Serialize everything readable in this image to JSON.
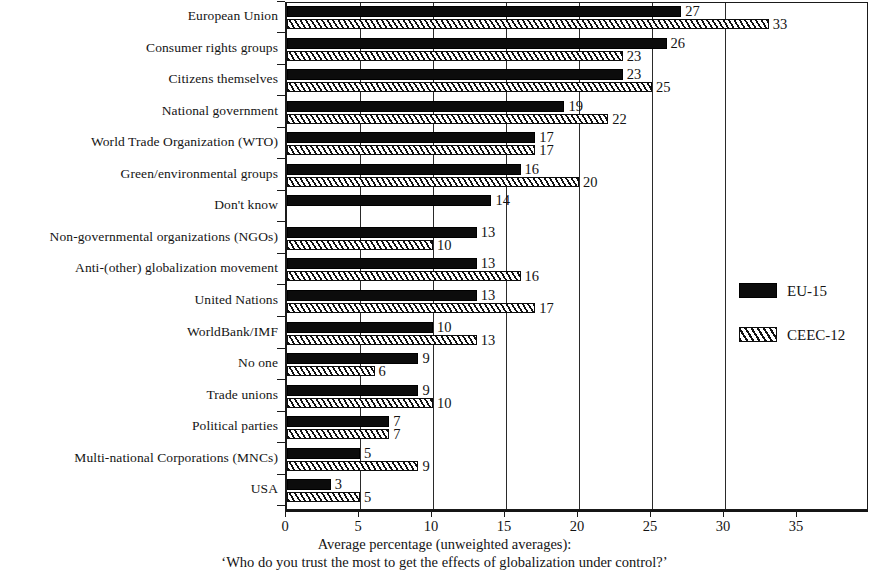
{
  "chart_data": {
    "type": "bar",
    "orientation": "horizontal",
    "title": "",
    "xlabel": "Average percentage (unweighted averages):",
    "subtitle": "‘Who do you trust the most to get the effects of globalization under control?’",
    "ylabel": "",
    "xlim": [
      0,
      35
    ],
    "xticks": [
      0,
      5,
      10,
      15,
      20,
      25,
      30,
      35
    ],
    "xticklabels": [
      "0",
      "5",
      "10",
      "15",
      "20",
      "25",
      "30",
      "35"
    ],
    "grid": "vertical",
    "legend_position": "inside-right",
    "categories": [
      "European Union",
      "Consumer rights groups",
      "Citizens themselves",
      "National government",
      "World Trade Organization (WTO)",
      "Green/environmental groups",
      "Don't know",
      "Non-governmental organizations (NGOs)",
      "Anti-(other) globalization movement",
      "United Nations",
      "WorldBank/IMF",
      "No one",
      "Trade unions",
      "Political parties",
      "Multi-national Corporations (MNCs)",
      "USA"
    ],
    "series": [
      {
        "name": "EU-15",
        "style": "solid-black",
        "color": "#0c0c0c",
        "values": [
          27,
          26,
          23,
          19,
          17,
          16,
          14,
          13,
          13,
          13,
          10,
          9,
          9,
          7,
          5,
          3
        ],
        "labels": [
          "27",
          "26",
          "23",
          "19",
          "17",
          "16",
          "14",
          "13",
          "13",
          "13",
          "10",
          "9",
          "9",
          "7",
          "5",
          "3"
        ]
      },
      {
        "name": "CEEC-12",
        "style": "diagonal-hatch",
        "color": "#111111",
        "values": [
          33,
          23,
          25,
          22,
          17,
          20,
          null,
          10,
          16,
          17,
          13,
          6,
          10,
          7,
          9,
          5
        ],
        "labels": [
          "33",
          "23",
          "25",
          "22",
          "17",
          "20",
          "",
          "10",
          "16",
          "17",
          "13",
          "6",
          "10",
          "7",
          "9",
          "5"
        ]
      }
    ]
  },
  "legend": {
    "entries": [
      {
        "label": "EU-15",
        "swatch": "solid-black-swatch"
      },
      {
        "label": "CEEC-12",
        "swatch": "hatched-swatch"
      }
    ]
  }
}
